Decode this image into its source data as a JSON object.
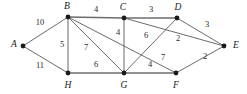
{
  "figure": {
    "type": "weighted-undirected-graph",
    "background_color": "#ffffff",
    "edge_color": "#5a5a5a",
    "vertex_color": "#1a1a1a",
    "label_color": "#1a1a1a"
  },
  "chart_data": {
    "type": "diagram",
    "title": "",
    "xlabel": "",
    "ylabel": "",
    "graph_kind": "weighted undirected graph",
    "vertex_count": 8,
    "edge_count": 14,
    "vertices": [
      {
        "id": "A",
        "label": "A",
        "x": 23,
        "y": 46,
        "label_x": 14,
        "label_y": 45
      },
      {
        "id": "B",
        "label": "B",
        "x": 68,
        "y": 17,
        "label_x": 67,
        "label_y": 7
      },
      {
        "id": "C",
        "label": "C",
        "x": 124,
        "y": 18,
        "label_x": 123,
        "label_y": 8
      },
      {
        "id": "D",
        "label": "D",
        "x": 177,
        "y": 18,
        "label_x": 178,
        "label_y": 8
      },
      {
        "id": "E",
        "label": "E",
        "x": 224,
        "y": 46,
        "label_x": 236,
        "label_y": 46
      },
      {
        "id": "F",
        "label": "F",
        "x": 176,
        "y": 73,
        "label_x": 176,
        "label_y": 86
      },
      {
        "id": "G",
        "label": "G",
        "x": 124,
        "y": 73,
        "label_x": 124,
        "label_y": 86
      },
      {
        "id": "H",
        "label": "H",
        "x": 68,
        "y": 73,
        "label_x": 68,
        "label_y": 86
      }
    ],
    "edges": [
      {
        "id": "A-B",
        "from": "A",
        "to": "B",
        "weight": "10",
        "label_x": 40,
        "label_y": 23,
        "heavy": false
      },
      {
        "id": "A-H",
        "from": "A",
        "to": "H",
        "weight": "11",
        "label_x": 40,
        "label_y": 66,
        "heavy": false
      },
      {
        "id": "B-C",
        "from": "B",
        "to": "C",
        "weight": "4",
        "label_x": 96,
        "label_y": 10,
        "heavy": true
      },
      {
        "id": "B-H",
        "from": "B",
        "to": "H",
        "weight": "5",
        "label_x": 62,
        "label_y": 45,
        "heavy": false
      },
      {
        "id": "B-G",
        "from": "B",
        "to": "G",
        "weight": "7",
        "label_x": 86,
        "label_y": 48,
        "heavy": false
      },
      {
        "id": "B-F",
        "from": "B",
        "to": "F",
        "weight": "7",
        "label_x": 163,
        "label_y": 58,
        "heavy": false
      },
      {
        "id": "C-D",
        "from": "C",
        "to": "D",
        "weight": "3",
        "label_x": 151,
        "label_y": 10,
        "heavy": true
      },
      {
        "id": "C-G",
        "from": "C",
        "to": "G",
        "weight": "4",
        "label_x": 118,
        "label_y": 33,
        "heavy": false
      },
      {
        "id": "C-E",
        "from": "C",
        "to": "E",
        "weight": "2",
        "label_x": 178,
        "label_y": 39,
        "heavy": false
      },
      {
        "id": "D-G",
        "from": "D",
        "to": "G",
        "weight": "6",
        "label_x": 146,
        "label_y": 36,
        "heavy": false
      },
      {
        "id": "D-E",
        "from": "D",
        "to": "E",
        "weight": "3",
        "label_x": 207,
        "label_y": 25,
        "heavy": false
      },
      {
        "id": "E-F",
        "from": "E",
        "to": "F",
        "weight": "2",
        "label_x": 205,
        "label_y": 57,
        "heavy": false
      },
      {
        "id": "F-G",
        "from": "F",
        "to": "G",
        "weight": "4",
        "label_x": 150,
        "label_y": 65,
        "heavy": true
      },
      {
        "id": "G-H",
        "from": "G",
        "to": "H",
        "weight": "6",
        "label_x": 96,
        "label_y": 65,
        "heavy": true
      }
    ],
    "weights_list": [
      "10",
      "11",
      "4",
      "5",
      "7",
      "7",
      "3",
      "4",
      "2",
      "6",
      "3",
      "2",
      "4",
      "6"
    ],
    "vertex_labels": [
      "A",
      "B",
      "C",
      "D",
      "E",
      "F",
      "G",
      "H"
    ]
  }
}
